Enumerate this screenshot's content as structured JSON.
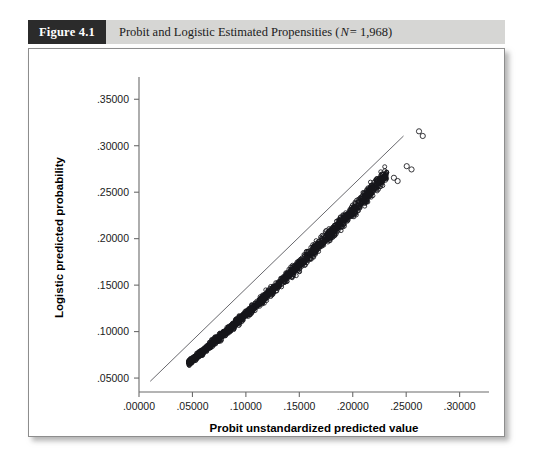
{
  "figure": {
    "number_label": "Figure 4.1",
    "title_prefix": "Probit and Logistic Estimated Propensities (",
    "title_italic_n": "N",
    "title_suffix": " = 1,968)",
    "full_title": "Probit and Logistic Estimated Propensities (N = 1,968)",
    "header_dark_color": "#2b2b2b",
    "header_strip_color": "#d6d6d4",
    "panel_border_color": "#8d8d8d"
  },
  "chart_data": {
    "type": "scatter",
    "title": "Probit and Logistic Estimated Propensities (N = 1,968)",
    "xlabel": "Probit unstandardized predicted value",
    "ylabel": "Logistic predicted probability",
    "xlim": [
      0.0,
      0.32
    ],
    "ylim": [
      0.035,
      0.3675
    ],
    "xticks": [
      0.0,
      0.05,
      0.1,
      0.15,
      0.2,
      0.25,
      0.3
    ],
    "xtick_labels": [
      ".00000",
      ".05000",
      ".10000",
      ".15000",
      ".20000",
      ".25000",
      ".30000"
    ],
    "yticks": [
      0.05,
      0.1,
      0.15,
      0.2,
      0.25,
      0.3,
      0.35
    ],
    "ytick_labels": [
      ".05000",
      ".10000",
      ".15000",
      ".20000",
      ".25000",
      ".30000",
      ".35000"
    ],
    "grid": false,
    "legend": null,
    "n_points": 1968,
    "marker": "open-circle",
    "marker_color": "#15151a",
    "reference_line": {
      "name": "identity-line",
      "slope": 1.0,
      "intercept": 0.0,
      "x_start": 0.0105,
      "x_end": 0.2475,
      "y_start": 0.0465,
      "y_end": 0.3105,
      "color": "#57575c",
      "description": "Thin straight diagonal reference line running above the point cloud"
    },
    "series": [
      {
        "name": "Probit vs Logistic propensity",
        "x_range": [
          0.0465,
          0.2655
        ],
        "y_range": [
          0.0665,
          0.3155
        ],
        "shape": "narrow upward-curving band lying below the diagonal reference line",
        "band_half_width_y": 0.0042,
        "curve_anchor_points": [
          {
            "x": 0.0465,
            "y": 0.0665
          },
          {
            "x": 0.06,
            "y": 0.079
          },
          {
            "x": 0.08,
            "y": 0.0985
          },
          {
            "x": 0.1,
            "y": 0.1185
          },
          {
            "x": 0.12,
            "y": 0.1395
          },
          {
            "x": 0.14,
            "y": 0.161
          },
          {
            "x": 0.16,
            "y": 0.1835
          },
          {
            "x": 0.18,
            "y": 0.2065
          },
          {
            "x": 0.2,
            "y": 0.2305
          },
          {
            "x": 0.215,
            "y": 0.249
          },
          {
            "x": 0.23,
            "y": 0.268
          },
          {
            "x": 0.238,
            "y": 0.264
          },
          {
            "x": 0.242,
            "y": 0.271
          },
          {
            "x": 0.255,
            "y": 0.2775
          },
          {
            "x": 0.262,
            "y": 0.3105
          },
          {
            "x": 0.2655,
            "y": 0.3155
          }
        ],
        "outlier_points": [
          {
            "x": 0.262,
            "y": 0.3155
          },
          {
            "x": 0.2655,
            "y": 0.3105
          },
          {
            "x": 0.2505,
            "y": 0.278
          },
          {
            "x": 0.255,
            "y": 0.2745
          },
          {
            "x": 0.2385,
            "y": 0.2655
          },
          {
            "x": 0.242,
            "y": 0.262
          }
        ]
      }
    ]
  }
}
